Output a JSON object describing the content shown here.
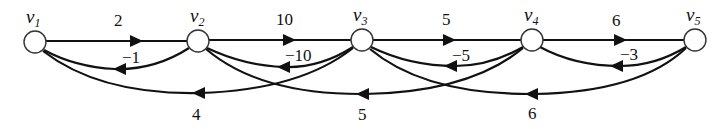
{
  "diagram": {
    "type": "directed-weighted-graph",
    "nodes": [
      {
        "id": "v1",
        "label": "v",
        "sub": "1",
        "x": 35,
        "y": 42
      },
      {
        "id": "v2",
        "label": "v",
        "sub": "2",
        "x": 198,
        "y": 41
      },
      {
        "id": "v3",
        "label": "v",
        "sub": "3",
        "x": 362,
        "y": 40
      },
      {
        "id": "v4",
        "label": "v",
        "sub": "4",
        "x": 532,
        "y": 40
      },
      {
        "id": "v5",
        "label": "v",
        "sub": "5",
        "x": 695,
        "y": 40
      }
    ],
    "edges": [
      {
        "from": "v1",
        "to": "v2",
        "weight": "2"
      },
      {
        "from": "v2",
        "to": "v3",
        "weight": "10"
      },
      {
        "from": "v3",
        "to": "v4",
        "weight": "5"
      },
      {
        "from": "v4",
        "to": "v5",
        "weight": "6"
      },
      {
        "from": "v2",
        "to": "v1",
        "weight": "−1"
      },
      {
        "from": "v3",
        "to": "v2",
        "weight": "−10"
      },
      {
        "from": "v4",
        "to": "v3",
        "weight": "−5"
      },
      {
        "from": "v5",
        "to": "v4",
        "weight": "−3"
      },
      {
        "from": "v3",
        "to": "v1",
        "weight": "4"
      },
      {
        "from": "v4",
        "to": "v2",
        "weight": "5"
      },
      {
        "from": "v5",
        "to": "v3",
        "weight": "6"
      }
    ]
  }
}
